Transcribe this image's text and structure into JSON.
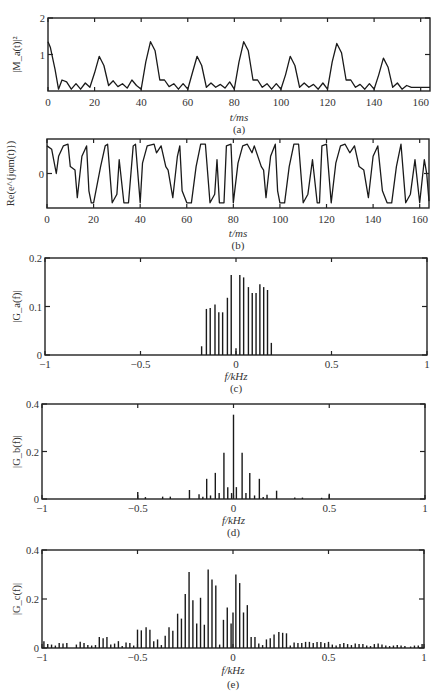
{
  "chart_data": [
    {
      "id": "a",
      "type": "line",
      "caption": "(a)",
      "title": "",
      "xlabel": "t/ms",
      "ylabel": "|M_a(t)|^2",
      "xlim": [
        0,
        164
      ],
      "ylim": [
        0,
        2
      ],
      "xticks": [
        0,
        20,
        40,
        60,
        80,
        100,
        120,
        140,
        160
      ],
      "yticks": [
        1,
        2
      ],
      "ytick_labels": [
        "1",
        "2"
      ],
      "grid": false,
      "description": "Periodic pulse envelope; alternating main lobes ~0.95 and ~1.35 every ~21.5 ms with small sidelobes (~0.1-0.35)",
      "x": [
        0,
        1,
        3,
        4.5,
        6,
        8,
        10,
        12,
        14,
        16,
        18,
        20,
        22,
        24,
        26,
        28,
        30,
        32,
        34,
        36,
        38,
        40,
        42,
        44,
        46,
        48,
        50,
        52,
        54,
        56,
        58,
        60,
        62,
        64,
        66,
        68,
        70,
        72,
        74,
        76,
        78,
        80,
        82,
        84,
        86,
        88,
        90,
        92,
        94,
        96,
        98,
        100,
        102,
        104,
        106,
        108,
        110,
        112,
        114,
        116,
        118,
        120,
        122,
        124,
        126,
        128,
        130,
        132,
        134,
        136,
        138,
        140,
        142,
        144,
        146,
        148,
        150,
        152,
        154,
        156,
        158,
        160,
        162,
        164
      ],
      "y": [
        1.35,
        1.2,
        0.6,
        0.05,
        0.3,
        0.25,
        0.05,
        0.2,
        0.05,
        0.22,
        0.1,
        0.5,
        0.95,
        0.7,
        0.15,
        0.28,
        0.12,
        0.2,
        0.08,
        0.3,
        0.15,
        0.05,
        0.8,
        1.35,
        1.1,
        0.3,
        0.3,
        0.12,
        0.2,
        0.05,
        0.2,
        0.05,
        0.5,
        0.95,
        0.7,
        0.1,
        0.22,
        0.1,
        0.18,
        0.08,
        0.25,
        0.05,
        0.8,
        1.35,
        1.1,
        0.3,
        0.3,
        0.1,
        0.2,
        0.05,
        0.2,
        0.05,
        0.45,
        0.95,
        0.7,
        0.1,
        0.22,
        0.1,
        0.18,
        0.05,
        0.22,
        0.05,
        0.8,
        1.3,
        1.05,
        0.3,
        0.3,
        0.1,
        0.18,
        0.05,
        0.2,
        0.05,
        0.45,
        0.9,
        0.65,
        0.1,
        0.22,
        0.05,
        0.15,
        0.1,
        0.1,
        0.1,
        0.1,
        0.1
      ]
    },
    {
      "id": "b",
      "type": "line",
      "caption": "(b)",
      "title": "",
      "xlabel": "t/ms",
      "ylabel": "Re(e^{jφm(t)})",
      "xlim": [
        0,
        164
      ],
      "ylim": [
        -1,
        1
      ],
      "xticks": [
        0,
        20,
        40,
        60,
        80,
        100,
        120,
        140,
        160
      ],
      "yticks": [
        0
      ],
      "ytick_labels": [
        "0"
      ],
      "grid": false,
      "description": "Real part of phase-modulated carrier oscillating between -1 and +1 with irregular, repeating pattern",
      "x": [
        0,
        2,
        4,
        5,
        7,
        9,
        10,
        12,
        13,
        15,
        17,
        18,
        19,
        20,
        23,
        25,
        26,
        28,
        30,
        31,
        33,
        35,
        37,
        38,
        40,
        41,
        43,
        46,
        47,
        49,
        51,
        52,
        54,
        56,
        57,
        58,
        60,
        62,
        64,
        66,
        68,
        70,
        72,
        73,
        74,
        76,
        77,
        79,
        80,
        82,
        84,
        86,
        88,
        89,
        92,
        93,
        94,
        96,
        98,
        99,
        100,
        102,
        104,
        106,
        108,
        110,
        112,
        114,
        116,
        117,
        118,
        120,
        122,
        124,
        126,
        128,
        130,
        132,
        134,
        136,
        138,
        140,
        142,
        144,
        146,
        148,
        150,
        152,
        154,
        156,
        158,
        160,
        162,
        163,
        164
      ],
      "y": [
        0.8,
        0.7,
        0.0,
        0.5,
        0.8,
        0.85,
        0.2,
        0.1,
        -0.7,
        0.5,
        0.8,
        -0.5,
        -0.85,
        -0.85,
        0.2,
        0.8,
        0.85,
        -0.85,
        -0.6,
        0.4,
        -0.85,
        -0.85,
        0.8,
        0.85,
        -0.85,
        0.3,
        0.8,
        0.85,
        0.6,
        0.8,
        0.2,
        0.1,
        -0.7,
        0.5,
        0.8,
        -0.5,
        -0.85,
        -0.85,
        0.2,
        0.85,
        0.85,
        -0.85,
        -0.6,
        0.4,
        -0.85,
        -0.85,
        0.8,
        0.85,
        -0.85,
        0.3,
        0.8,
        0.85,
        0.6,
        0.8,
        0.2,
        0.1,
        -0.7,
        0.5,
        0.85,
        -0.5,
        -0.85,
        -0.85,
        0.2,
        0.85,
        0.85,
        -0.85,
        -0.6,
        0.4,
        -0.85,
        -0.85,
        0.8,
        0.85,
        -0.85,
        0.3,
        0.8,
        0.85,
        0.6,
        0.8,
        0.2,
        0.1,
        -0.7,
        0.5,
        0.8,
        -0.5,
        -0.85,
        -0.85,
        0.2,
        0.85,
        -0.85,
        -0.6,
        0.4,
        -0.85,
        0.4,
        0.0,
        -0.8
      ]
    },
    {
      "id": "c",
      "type": "bar",
      "caption": "(c)",
      "title": "",
      "xlabel": "f/kHz",
      "ylabel": "|G_a(f)|",
      "xlim": [
        -1,
        1
      ],
      "ylim": [
        0,
        0.2
      ],
      "xticks": [
        -1,
        -0.5,
        0,
        0.5,
        1
      ],
      "xtick_labels": [
        "−1",
        "−0.5",
        "0",
        "0.5",
        "1"
      ],
      "yticks": [
        0,
        0.1,
        0.2
      ],
      "ytick_labels": [
        "0",
        "0.1",
        "0.2"
      ],
      "grid": false,
      "x": [
        -0.18,
        -0.155,
        -0.135,
        -0.11,
        -0.09,
        -0.07,
        -0.045,
        -0.025,
        0.0,
        0.02,
        0.04,
        0.065,
        0.085,
        0.105,
        0.125,
        0.145,
        0.165,
        0.185
      ],
      "values": [
        0.018,
        0.095,
        0.097,
        0.104,
        0.088,
        0.088,
        0.118,
        0.165,
        0.014,
        0.165,
        0.16,
        0.14,
        0.128,
        0.128,
        0.146,
        0.14,
        0.134,
        0.025
      ]
    },
    {
      "id": "d",
      "type": "bar",
      "caption": "(d)",
      "title": "",
      "xlabel": "f/kHz",
      "ylabel": "|G_b(f)|",
      "xlim": [
        -1,
        1
      ],
      "ylim": [
        0,
        0.4
      ],
      "xticks": [
        -1,
        -0.5,
        0,
        0.5,
        1
      ],
      "xtick_labels": [
        "−1",
        "−0.5",
        "0",
        "0.5",
        "1"
      ],
      "yticks": [
        0,
        0.2,
        0.4
      ],
      "ytick_labels": [
        "0",
        "0.2",
        "0.4"
      ],
      "grid": false,
      "x": [
        -0.5,
        -0.46,
        -0.37,
        -0.33,
        -0.23,
        -0.18,
        -0.16,
        -0.14,
        -0.12,
        -0.095,
        -0.075,
        -0.05,
        -0.03,
        -0.01,
        0.0,
        0.015,
        0.045,
        0.065,
        0.085,
        0.11,
        0.135,
        0.155,
        0.175,
        0.225,
        0.32,
        0.36,
        0.46,
        0.5
      ],
      "values": [
        0.03,
        0.008,
        0.01,
        0.01,
        0.038,
        0.02,
        0.01,
        0.085,
        0.015,
        0.11,
        0.025,
        0.195,
        0.05,
        0.025,
        0.355,
        0.05,
        0.195,
        0.025,
        0.11,
        0.015,
        0.085,
        0.008,
        0.018,
        0.035,
        0.006,
        0.006,
        0.005,
        0.022
      ]
    },
    {
      "id": "e",
      "type": "bar",
      "caption": "(e)",
      "title": "",
      "xlabel": "f/kHz",
      "ylabel": "|G_c(f)|",
      "xlim": [
        -1,
        1
      ],
      "ylim": [
        0,
        0.4
      ],
      "xticks": [
        -1,
        -0.5,
        0,
        0.5,
        1
      ],
      "xtick_labels": [
        "−1",
        "−0.5",
        "0",
        "0.5",
        "1"
      ],
      "yticks": [
        0,
        0.2,
        0.4
      ],
      "ytick_labels": [
        "0",
        "0.2",
        "0.4"
      ],
      "grid": false,
      "x": [
        -0.99,
        -0.97,
        -0.95,
        -0.93,
        -0.91,
        -0.89,
        -0.87,
        -0.82,
        -0.8,
        -0.78,
        -0.76,
        -0.74,
        -0.72,
        -0.7,
        -0.68,
        -0.66,
        -0.64,
        -0.62,
        -0.6,
        -0.58,
        -0.56,
        -0.54,
        -0.52,
        -0.5,
        -0.48,
        -0.455,
        -0.435,
        -0.415,
        -0.395,
        -0.375,
        -0.355,
        -0.335,
        -0.315,
        -0.29,
        -0.27,
        -0.25,
        -0.23,
        -0.21,
        -0.19,
        -0.17,
        -0.15,
        -0.13,
        -0.11,
        -0.09,
        -0.07,
        -0.05,
        -0.03,
        -0.01,
        0.0,
        0.015,
        0.035,
        0.055,
        0.075,
        0.095,
        0.115,
        0.135,
        0.155,
        0.175,
        0.195,
        0.215,
        0.24,
        0.26,
        0.28,
        0.3,
        0.32,
        0.34,
        0.36,
        0.38,
        0.4,
        0.42,
        0.44,
        0.46,
        0.48,
        0.5,
        0.52,
        0.54,
        0.56,
        0.58,
        0.6,
        0.62,
        0.64,
        0.66,
        0.68,
        0.7,
        0.72,
        0.74,
        0.76,
        0.78,
        0.8,
        0.82,
        0.84,
        0.86,
        0.88,
        0.9,
        0.93,
        0.95,
        0.97,
        0.99
      ],
      "values": [
        0.028,
        0.016,
        0.014,
        0.01,
        0.02,
        0.018,
        0.02,
        0.014,
        0.026,
        0.02,
        0.012,
        0.01,
        0.012,
        0.045,
        0.04,
        0.045,
        0.014,
        0.018,
        0.028,
        0.008,
        0.022,
        0.02,
        0.01,
        0.075,
        0.072,
        0.085,
        0.075,
        0.028,
        0.035,
        0.012,
        0.05,
        0.085,
        0.07,
        0.14,
        0.12,
        0.22,
        0.31,
        0.195,
        0.1,
        0.205,
        0.095,
        0.32,
        0.28,
        0.255,
        0.014,
        0.115,
        0.165,
        0.1,
        0.145,
        0.3,
        0.265,
        0.145,
        0.175,
        0.045,
        0.045,
        0.018,
        0.012,
        0.035,
        0.04,
        0.055,
        0.065,
        0.062,
        0.06,
        0.01,
        0.022,
        0.02,
        0.02,
        0.025,
        0.025,
        0.02,
        0.025,
        0.025,
        0.02,
        0.025,
        0.014,
        0.01,
        0.016,
        0.02,
        0.016,
        0.012,
        0.018,
        0.016,
        0.016,
        0.01,
        0.008,
        0.016,
        0.018,
        0.014,
        0.01,
        0.008,
        0.01,
        0.012,
        0.01,
        0.008,
        0.006,
        0.01,
        0.01,
        0.016
      ]
    }
  ],
  "labels": {
    "a": {
      "caption": "(a)",
      "xlabel": "t/ms",
      "ylabel": "|M_a(t)|²",
      "xticks": [
        "0",
        "20",
        "40",
        "60",
        "80",
        "100",
        "120",
        "140",
        "160"
      ],
      "yticks": [
        "1",
        "2"
      ]
    },
    "b": {
      "caption": "(b)",
      "xlabel": "t/ms",
      "ylabel": "Re(e^{jφm(t)})",
      "xticks": [
        "0",
        "20",
        "40",
        "60",
        "80",
        "100",
        "120",
        "140",
        "160"
      ],
      "yticks": [
        "0"
      ]
    },
    "c": {
      "caption": "(c)",
      "xlabel": "f/kHz",
      "ylabel": "|G_a(f)|",
      "xticks": [
        "−1",
        "−0.5",
        "0",
        "0.5",
        "1"
      ],
      "yticks": [
        "0",
        "0.1",
        "0.2"
      ]
    },
    "d": {
      "caption": "(d)",
      "xlabel": "f/kHz",
      "ylabel": "|G_b(f)|",
      "xticks": [
        "−1",
        "−0.5",
        "0",
        "0.5",
        "1"
      ],
      "yticks": [
        "0",
        "0.2",
        "0.4"
      ]
    },
    "e": {
      "caption": "(e)",
      "xlabel": "f/kHz",
      "ylabel": "|G_c(f)|",
      "xticks": [
        "−1",
        "−0.5",
        "0",
        "0.5",
        "1"
      ],
      "yticks": [
        "0",
        "0.2",
        "0.4"
      ]
    }
  }
}
